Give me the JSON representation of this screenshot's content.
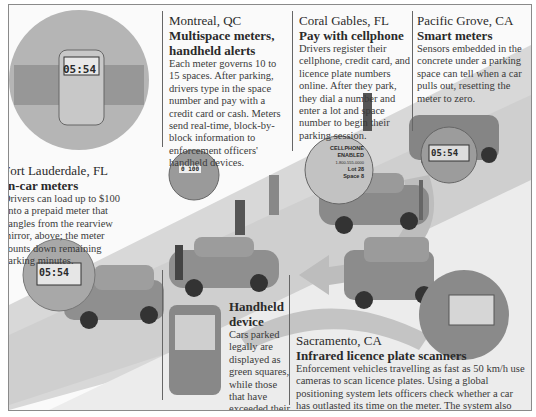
{
  "sections": {
    "fort_lauderdale": {
      "city": "Fort Lauderdale, FL",
      "heading": "In-car meters",
      "body": "Drivers can load up to $100 onto a prepaid meter that dangles from the rearview mirror, above; the meter counts down remaining parking minutes."
    },
    "montreal": {
      "city": "Montreal, QC",
      "heading": "Multispace meters, handheld alerts",
      "body": "Each meter governs 10 to 15 spaces. After parking, drivers type in the space number and pay with a credit card or cash. Meters send real-time, block-by-block information to enforcement officers' handheld devices."
    },
    "coral_gables": {
      "city": "Coral Gables, FL",
      "heading": "Pay with cellphone",
      "body": "Drivers register their cellphone, credit card, and licence plate numbers online. After they park, they dial a number and enter a lot and space number to begin their parking session."
    },
    "pacific_grove": {
      "city": "Pacific Grove, CA",
      "heading": "Smart meters",
      "body": "Sensors embedded in the concrete under a parking space can tell when a car pulls out, resetting the meter to zero."
    },
    "handheld": {
      "heading": "Handheld device",
      "body": "Cars parked legally are displayed as green squares, while those that have exceeded their time limit turn red."
    },
    "sacramento": {
      "city": "Sacramento, CA",
      "heading": "Infrared licence plate scanners",
      "body": "Enforcement vehicles travelling as fast as 50 km/h use cameras to scan licence plates. Using a global positioning system lets officers check whether a car has outlasted its time on the meter. The system also can match licence plates against databases of unpaid parking tickets and stolen vehicles."
    }
  },
  "meter_displays": {
    "in_car": "05:54",
    "callout": "05:54",
    "smart": "05:54",
    "multispace": "0 100"
  },
  "cellphone_bubble": {
    "line1": "CELLPHONE",
    "line2": "ENABLED",
    "line3": "1-800-555-0000",
    "line4": "Lot 28",
    "line5": "Space 8"
  }
}
